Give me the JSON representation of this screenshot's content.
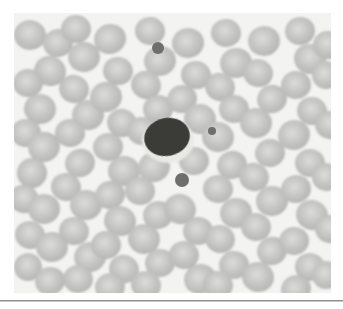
{
  "figure": {
    "kind": "micrograph",
    "modality": "light-microscopy-blood-smear",
    "caption": "",
    "background_color": "#f3f3f2",
    "matte_color": "#ffffff",
    "divider_color": "#8d8d8d",
    "field": {
      "x": 14,
      "y": 13,
      "width": 317,
      "height": 280
    }
  },
  "palette": {
    "rbc_fill": "#c6c6c4",
    "rbc_edge": "#b4b4b2",
    "rbc_center": "#dcdcda",
    "wbc_nucleus": "#3a3a38",
    "wbc_cytoplasm": "#e9e9e6",
    "platelet": "#6e6e6c",
    "background": "#f3f3f2"
  },
  "cells": {
    "wbc": [
      {
        "id": "wbc-1",
        "type": "lymphocyte",
        "cx": 153,
        "cy": 124,
        "rx": 23,
        "ry": 19,
        "rot": -12,
        "nucleus_color": "#3a3a38"
      }
    ],
    "platelets": [
      {
        "id": "platelet-1",
        "cx": 144,
        "cy": 35,
        "r": 6
      },
      {
        "id": "platelet-2",
        "cx": 198,
        "cy": 118,
        "r": 4
      },
      {
        "id": "platelet-3",
        "cx": 168,
        "cy": 167,
        "r": 7
      }
    ],
    "rbc": [
      {
        "cx": 16,
        "cy": 22,
        "rx": 16,
        "ry": 15,
        "rot": 8
      },
      {
        "cx": 44,
        "cy": 30,
        "rx": 15,
        "ry": 14,
        "rot": -14
      },
      {
        "cx": 36,
        "cy": 58,
        "rx": 16,
        "ry": 15,
        "rot": 20
      },
      {
        "cx": 14,
        "cy": 70,
        "rx": 15,
        "ry": 14,
        "rot": -5
      },
      {
        "cx": 26,
        "cy": 96,
        "rx": 16,
        "ry": 15,
        "rot": 12
      },
      {
        "cx": 12,
        "cy": 120,
        "rx": 15,
        "ry": 14,
        "rot": 0
      },
      {
        "cx": 30,
        "cy": 134,
        "rx": 16,
        "ry": 15,
        "rot": -18
      },
      {
        "cx": 18,
        "cy": 160,
        "rx": 15,
        "ry": 15,
        "rot": 6
      },
      {
        "cx": 10,
        "cy": 186,
        "rx": 15,
        "ry": 14,
        "rot": 22
      },
      {
        "cx": 30,
        "cy": 196,
        "rx": 16,
        "ry": 15,
        "rot": -9
      },
      {
        "cx": 16,
        "cy": 222,
        "rx": 15,
        "ry": 14,
        "rot": 14
      },
      {
        "cx": 38,
        "cy": 234,
        "rx": 16,
        "ry": 15,
        "rot": -3
      },
      {
        "cx": 14,
        "cy": 254,
        "rx": 14,
        "ry": 14,
        "rot": 10
      },
      {
        "cx": 36,
        "cy": 268,
        "rx": 15,
        "ry": 14,
        "rot": -16
      },
      {
        "cx": 62,
        "cy": 16,
        "rx": 15,
        "ry": 14,
        "rot": 5
      },
      {
        "cx": 70,
        "cy": 44,
        "rx": 16,
        "ry": 15,
        "rot": -11
      },
      {
        "cx": 60,
        "cy": 76,
        "rx": 15,
        "ry": 14,
        "rot": 18
      },
      {
        "cx": 74,
        "cy": 102,
        "rx": 16,
        "ry": 15,
        "rot": -7
      },
      {
        "cx": 56,
        "cy": 120,
        "rx": 15,
        "ry": 14,
        "rot": 3
      },
      {
        "cx": 66,
        "cy": 150,
        "rx": 15,
        "ry": 14,
        "rot": -20
      },
      {
        "cx": 52,
        "cy": 174,
        "rx": 15,
        "ry": 14,
        "rot": 9
      },
      {
        "cx": 72,
        "cy": 192,
        "rx": 16,
        "ry": 15,
        "rot": -4
      },
      {
        "cx": 60,
        "cy": 218,
        "rx": 15,
        "ry": 14,
        "rot": 16
      },
      {
        "cx": 76,
        "cy": 244,
        "rx": 16,
        "ry": 15,
        "rot": -12
      },
      {
        "cx": 64,
        "cy": 266,
        "rx": 15,
        "ry": 14,
        "rot": 7
      },
      {
        "cx": 96,
        "cy": 26,
        "rx": 16,
        "ry": 15,
        "rot": -15
      },
      {
        "cx": 104,
        "cy": 58,
        "rx": 15,
        "ry": 14,
        "rot": 11
      },
      {
        "cx": 92,
        "cy": 84,
        "rx": 16,
        "ry": 15,
        "rot": -6
      },
      {
        "cx": 108,
        "cy": 110,
        "rx": 15,
        "ry": 14,
        "rot": 19
      },
      {
        "cx": 94,
        "cy": 134,
        "rx": 15,
        "ry": 14,
        "rot": -10
      },
      {
        "cx": 110,
        "cy": 158,
        "rx": 16,
        "ry": 15,
        "rot": 4
      },
      {
        "cx": 96,
        "cy": 182,
        "rx": 15,
        "ry": 14,
        "rot": -17
      },
      {
        "cx": 106,
        "cy": 208,
        "rx": 16,
        "ry": 15,
        "rot": 13
      },
      {
        "cx": 92,
        "cy": 232,
        "rx": 15,
        "ry": 14,
        "rot": -2
      },
      {
        "cx": 110,
        "cy": 256,
        "rx": 15,
        "ry": 14,
        "rot": 21
      },
      {
        "cx": 96,
        "cy": 274,
        "rx": 15,
        "ry": 14,
        "rot": -8
      },
      {
        "cx": 136,
        "cy": 18,
        "rx": 15,
        "ry": 14,
        "rot": 6
      },
      {
        "cx": 146,
        "cy": 48,
        "rx": 16,
        "ry": 15,
        "rot": -13
      },
      {
        "cx": 132,
        "cy": 72,
        "rx": 15,
        "ry": 14,
        "rot": 17
      },
      {
        "cx": 144,
        "cy": 96,
        "rx": 15,
        "ry": 14,
        "rot": -5
      },
      {
        "cx": 128,
        "cy": 118,
        "rx": 15,
        "ry": 14,
        "rot": 10
      },
      {
        "cx": 140,
        "cy": 154,
        "rx": 16,
        "ry": 15,
        "rot": -19
      },
      {
        "cx": 126,
        "cy": 178,
        "rx": 15,
        "ry": 14,
        "rot": 2
      },
      {
        "cx": 144,
        "cy": 202,
        "rx": 15,
        "ry": 14,
        "rot": -14
      },
      {
        "cx": 130,
        "cy": 226,
        "rx": 16,
        "ry": 15,
        "rot": 8
      },
      {
        "cx": 146,
        "cy": 250,
        "rx": 15,
        "ry": 14,
        "rot": -6
      },
      {
        "cx": 132,
        "cy": 272,
        "rx": 15,
        "ry": 14,
        "rot": 15
      },
      {
        "cx": 174,
        "cy": 30,
        "rx": 16,
        "ry": 15,
        "rot": -9
      },
      {
        "cx": 182,
        "cy": 62,
        "rx": 15,
        "ry": 14,
        "rot": 12
      },
      {
        "cx": 168,
        "cy": 86,
        "rx": 15,
        "ry": 14,
        "rot": -16
      },
      {
        "cx": 186,
        "cy": 106,
        "rx": 16,
        "ry": 15,
        "rot": 5
      },
      {
        "cx": 180,
        "cy": 148,
        "rx": 15,
        "ry": 14,
        "rot": -11
      },
      {
        "cx": 166,
        "cy": 196,
        "rx": 16,
        "ry": 15,
        "rot": 18
      },
      {
        "cx": 184,
        "cy": 218,
        "rx": 15,
        "ry": 14,
        "rot": -3
      },
      {
        "cx": 170,
        "cy": 242,
        "rx": 15,
        "ry": 14,
        "rot": 9
      },
      {
        "cx": 186,
        "cy": 266,
        "rx": 16,
        "ry": 15,
        "rot": -15
      },
      {
        "cx": 212,
        "cy": 20,
        "rx": 15,
        "ry": 14,
        "rot": 7
      },
      {
        "cx": 222,
        "cy": 50,
        "rx": 16,
        "ry": 15,
        "rot": -12
      },
      {
        "cx": 206,
        "cy": 74,
        "rx": 15,
        "ry": 14,
        "rot": 20
      },
      {
        "cx": 220,
        "cy": 96,
        "rx": 15,
        "ry": 14,
        "rot": -4
      },
      {
        "cx": 204,
        "cy": 124,
        "rx": 16,
        "ry": 15,
        "rot": 11
      },
      {
        "cx": 218,
        "cy": 152,
        "rx": 15,
        "ry": 14,
        "rot": -18
      },
      {
        "cx": 204,
        "cy": 176,
        "rx": 15,
        "ry": 14,
        "rot": 3
      },
      {
        "cx": 222,
        "cy": 200,
        "rx": 16,
        "ry": 15,
        "rot": -10
      },
      {
        "cx": 206,
        "cy": 226,
        "rx": 15,
        "ry": 14,
        "rot": 16
      },
      {
        "cx": 220,
        "cy": 252,
        "rx": 15,
        "ry": 14,
        "rot": -6
      },
      {
        "cx": 204,
        "cy": 272,
        "rx": 15,
        "ry": 14,
        "rot": 13
      },
      {
        "cx": 250,
        "cy": 28,
        "rx": 16,
        "ry": 15,
        "rot": -8
      },
      {
        "cx": 244,
        "cy": 60,
        "rx": 15,
        "ry": 14,
        "rot": 14
      },
      {
        "cx": 258,
        "cy": 86,
        "rx": 15,
        "ry": 14,
        "rot": -17
      },
      {
        "cx": 242,
        "cy": 110,
        "rx": 16,
        "ry": 15,
        "rot": 2
      },
      {
        "cx": 256,
        "cy": 140,
        "rx": 15,
        "ry": 14,
        "rot": -13
      },
      {
        "cx": 240,
        "cy": 164,
        "rx": 15,
        "ry": 14,
        "rot": 19
      },
      {
        "cx": 258,
        "cy": 188,
        "rx": 16,
        "ry": 15,
        "rot": -5
      },
      {
        "cx": 242,
        "cy": 214,
        "rx": 15,
        "ry": 14,
        "rot": 10
      },
      {
        "cx": 258,
        "cy": 238,
        "rx": 15,
        "ry": 14,
        "rot": -20
      },
      {
        "cx": 244,
        "cy": 264,
        "rx": 16,
        "ry": 15,
        "rot": 6
      },
      {
        "cx": 286,
        "cy": 18,
        "rx": 15,
        "ry": 14,
        "rot": -11
      },
      {
        "cx": 296,
        "cy": 46,
        "rx": 16,
        "ry": 15,
        "rot": 15
      },
      {
        "cx": 282,
        "cy": 72,
        "rx": 15,
        "ry": 14,
        "rot": -2
      },
      {
        "cx": 298,
        "cy": 98,
        "rx": 15,
        "ry": 14,
        "rot": 12
      },
      {
        "cx": 280,
        "cy": 122,
        "rx": 16,
        "ry": 15,
        "rot": -16
      },
      {
        "cx": 296,
        "cy": 150,
        "rx": 15,
        "ry": 14,
        "rot": 4
      },
      {
        "cx": 282,
        "cy": 176,
        "rx": 15,
        "ry": 14,
        "rot": -9
      },
      {
        "cx": 298,
        "cy": 202,
        "rx": 16,
        "ry": 15,
        "rot": 17
      },
      {
        "cx": 280,
        "cy": 228,
        "rx": 15,
        "ry": 14,
        "rot": -6
      },
      {
        "cx": 296,
        "cy": 254,
        "rx": 15,
        "ry": 14,
        "rot": 8
      },
      {
        "cx": 282,
        "cy": 276,
        "rx": 15,
        "ry": 14,
        "rot": -14
      },
      {
        "cx": 314,
        "cy": 32,
        "rx": 15,
        "ry": 14,
        "rot": 5
      },
      {
        "cx": 312,
        "cy": 62,
        "rx": 14,
        "ry": 14,
        "rot": -12
      },
      {
        "cx": 316,
        "cy": 112,
        "rx": 15,
        "ry": 14,
        "rot": 18
      },
      {
        "cx": 312,
        "cy": 164,
        "rx": 14,
        "ry": 14,
        "rot": -7
      },
      {
        "cx": 316,
        "cy": 216,
        "rx": 15,
        "ry": 14,
        "rot": 11
      },
      {
        "cx": 312,
        "cy": 262,
        "rx": 14,
        "ry": 14,
        "rot": -3
      }
    ]
  }
}
